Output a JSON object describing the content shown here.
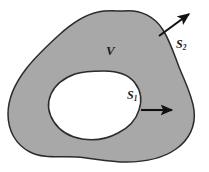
{
  "figure": {
    "type": "vector-field-region-diagram",
    "background_color": "#ffffff",
    "fill_color": "#a8a8a8",
    "outline_color": "#2b2b2b",
    "hole_fill_color": "#ffffff",
    "arrow_color": "#111111",
    "labels": [
      {
        "id": "volume",
        "base": "V",
        "subscript": "",
        "x": 106,
        "y": 44
      },
      {
        "id": "inner-surface",
        "base": "S",
        "subscript": "1",
        "x": 127,
        "y": 89
      },
      {
        "id": "outer-surface",
        "base": "S",
        "subscript": "2",
        "x": 176,
        "y": 38
      }
    ],
    "arrows": [
      {
        "id": "outer-normal",
        "from_x": 159,
        "from_y": 36,
        "to_x": 192,
        "to_y": 12,
        "label_ref": "outer-surface"
      },
      {
        "id": "inner-normal",
        "from_x": 143,
        "from_y": 110,
        "to_x": 176,
        "to_y": 110,
        "label_ref": "inner-surface"
      }
    ]
  }
}
